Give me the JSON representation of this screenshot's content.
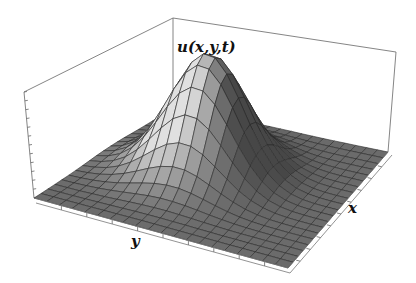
{
  "chart_data": {
    "type": "surface3d",
    "title": "",
    "zlabel": "u(x,y,t)",
    "xlabel": "x",
    "ylabel": "y",
    "grid": {
      "nx": 20,
      "ny": 20
    },
    "surface": {
      "function": "exp(-((x-0.5)^2+(y-0.5)^2)/0.04)",
      "peak": {
        "x": 0.5,
        "y": 0.5,
        "z": 1.0
      }
    },
    "ticks": {
      "x": "unlabeled",
      "y": "unlabeled",
      "z": "unlabeled"
    },
    "colors": {
      "surface_light": "#d8d8d8",
      "surface_dark": "#4a4a4a",
      "mesh_line": "#2a2a2a",
      "box_line": "#555555"
    }
  },
  "labels": {
    "z": "u(x,y,t)",
    "x": "x",
    "y": "y"
  }
}
